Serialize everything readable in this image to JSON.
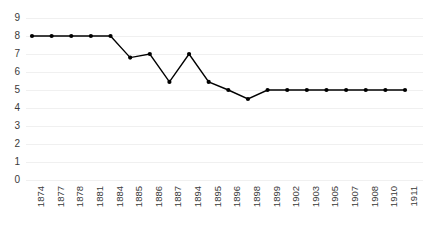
{
  "chart_data": {
    "type": "line",
    "title": "",
    "subtitle": "",
    "xlabel": "",
    "ylabel": "",
    "categories": [
      "1874",
      "1877",
      "1878",
      "1881",
      "1884",
      "1885",
      "1886",
      "1887",
      "1894",
      "1895",
      "1896",
      "1898",
      "1899",
      "1902",
      "1903",
      "1905",
      "1907",
      "1908",
      "1910",
      "1911"
    ],
    "values": [
      8,
      8,
      8,
      8,
      8,
      6.8,
      7,
      5.45,
      7,
      5.45,
      5,
      4.5,
      5,
      5,
      5,
      5,
      5,
      5,
      5,
      5
    ],
    "series": [
      {
        "name": "",
        "values": [
          8,
          8,
          8,
          8,
          8,
          6.8,
          7,
          5.45,
          7,
          5.45,
          5,
          4.5,
          5,
          5,
          5,
          5,
          5,
          5,
          5,
          5
        ]
      }
    ],
    "ylim": [
      0,
      9
    ],
    "yticks": [
      0,
      1,
      2,
      3,
      4,
      5,
      6,
      7,
      8,
      9
    ],
    "ytick_labels": [
      "0",
      "1",
      "2",
      "3",
      "4",
      "5",
      "6",
      "7",
      "8",
      "9"
    ],
    "xtick_labels": [
      "1874",
      "1877",
      "1878",
      "1881",
      "1884",
      "1885",
      "1886",
      "1887",
      "1894",
      "1895",
      "1896",
      "1898",
      "1899",
      "1902",
      "1903",
      "1905",
      "1907",
      "1908",
      "1910",
      "1911"
    ],
    "grid": true,
    "grid_axis": "y",
    "legend": false,
    "legend_position": "none",
    "marker": "circle",
    "annotations": []
  },
  "style": {
    "line_color": "#000000",
    "marker_color": "#000000",
    "grid_color": "#f0f0f0",
    "tick_label_color": "#3a3a3a",
    "background_color": "#ffffff"
  }
}
